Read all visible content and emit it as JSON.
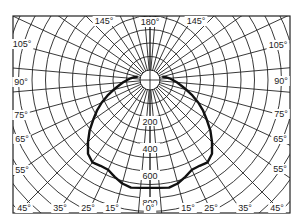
{
  "chart_data": {
    "type": "polar-line",
    "title": "",
    "center_px": [
      150,
      80
    ],
    "radial_unit": "cd",
    "radial_ticks": [
      200,
      400,
      600,
      800
    ],
    "radial_px_per_100": 13.5,
    "angle_labels": [
      {
        "text": "180°",
        "angle": 180,
        "x": 150,
        "y": 25
      },
      {
        "text": "145°",
        "angle": 145,
        "x": 104,
        "y": 24,
        "side": "left"
      },
      {
        "text": "145°",
        "angle": 145,
        "x": 196,
        "y": 24,
        "side": "right"
      },
      {
        "text": "105°",
        "angle": 105,
        "x": 22,
        "y": 47,
        "side": "left"
      },
      {
        "text": "105°",
        "angle": 105,
        "x": 278,
        "y": 48,
        "side": "right"
      },
      {
        "text": "90°",
        "angle": 90,
        "x": 21,
        "y": 85,
        "side": "left"
      },
      {
        "text": "90°",
        "angle": 90,
        "x": 281,
        "y": 84,
        "side": "right"
      },
      {
        "text": "75°",
        "angle": 75,
        "x": 21,
        "y": 118,
        "side": "left"
      },
      {
        "text": "75°",
        "angle": 75,
        "x": 281,
        "y": 117,
        "side": "right"
      },
      {
        "text": "65°",
        "angle": 65,
        "x": 22,
        "y": 142,
        "side": "left"
      },
      {
        "text": "65°",
        "angle": 65,
        "x": 280,
        "y": 142,
        "side": "right"
      },
      {
        "text": "55°",
        "angle": 55,
        "x": 22,
        "y": 173,
        "side": "left"
      },
      {
        "text": "55°",
        "angle": 55,
        "x": 280,
        "y": 172,
        "side": "right"
      },
      {
        "text": "45°",
        "angle": 45,
        "x": 24,
        "y": 211,
        "side": "left"
      },
      {
        "text": "35°",
        "angle": 35,
        "x": 60,
        "y": 211,
        "side": "left"
      },
      {
        "text": "25°",
        "angle": 25,
        "x": 88,
        "y": 211,
        "side": "left"
      },
      {
        "text": "15°",
        "angle": 15,
        "x": 112,
        "y": 211,
        "side": "left"
      },
      {
        "text": "0°",
        "angle": 0,
        "x": 150,
        "y": 211
      },
      {
        "text": "15°",
        "angle": 15,
        "x": 188,
        "y": 211,
        "side": "right"
      },
      {
        "text": "25°",
        "angle": 25,
        "x": 211,
        "y": 211,
        "side": "right"
      },
      {
        "text": "35°",
        "angle": 35,
        "x": 245,
        "y": 211,
        "side": "right"
      },
      {
        "text": "45°",
        "angle": 45,
        "x": 277,
        "y": 211,
        "side": "right"
      }
    ],
    "series": [
      {
        "name": "intensity",
        "angles": [
          0,
          5,
          10,
          15,
          20,
          25,
          30,
          35,
          40,
          45,
          50,
          55,
          60,
          65,
          70,
          75,
          80,
          85,
          90,
          95,
          100,
          105
        ],
        "values": [
          725,
          728,
          735,
          720,
          690,
          660,
          660,
          670,
          640,
          575,
          510,
          440,
          380,
          320,
          260,
          205,
          160,
          125,
          95,
          70,
          45,
          20
        ]
      }
    ],
    "grid": true,
    "frame_px": [
      13,
      16,
      290,
      213
    ]
  }
}
